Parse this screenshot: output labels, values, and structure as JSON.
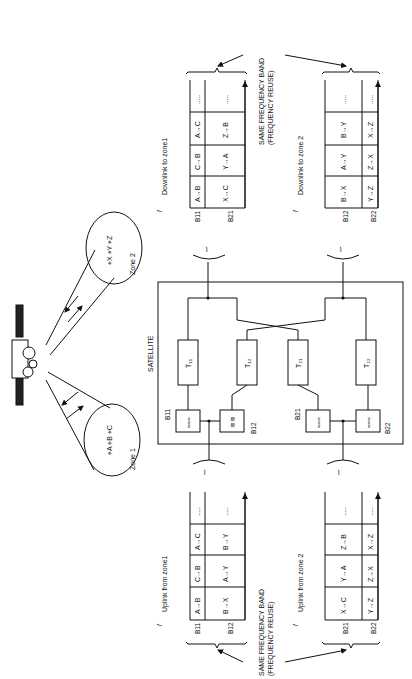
{
  "figure": {
    "orientation": "rotated-90-ccw",
    "satellite_label": "SATELLITE",
    "zones": [
      {
        "label": "Zone 1",
        "stations": [
          "A",
          "B",
          "C"
        ]
      },
      {
        "label": "Zone 2",
        "stations": [
          "X",
          "Y",
          "Z"
        ]
      }
    ],
    "transponders": [
      "T11",
      "T12",
      "T21",
      "T22"
    ],
    "filters": [
      "B11",
      "B12",
      "B21",
      "B22"
    ],
    "annotation": {
      "line1": "SAME FREQUENCY BAND",
      "line2": "(FREQUENCY REUSE)"
    },
    "axis_label": "f",
    "frames": {
      "uplink_zone1": {
        "title": "Uplink from zone1",
        "rows": [
          {
            "band": "B11",
            "cells": [
              "A→B",
              "C→B",
              "A→C",
              "....."
            ]
          },
          {
            "band": "B12",
            "cells": [
              "B→X",
              "A→Y",
              "B→Y",
              "....."
            ]
          }
        ]
      },
      "uplink_zone2": {
        "title": "Uplink from zone 2",
        "rows": [
          {
            "band": "B21",
            "cells": [
              "X→C",
              "Y→A",
              "Z→B",
              "....."
            ]
          },
          {
            "band": "B22",
            "cells": [
              "Y→Z",
              "Z→X",
              "X→Z",
              "....."
            ]
          }
        ]
      },
      "downlink_zone1": {
        "title": "Downlink to zone1",
        "rows": [
          {
            "band": "B11",
            "cells": [
              "A→B",
              "C→B",
              "A→C",
              "....."
            ]
          },
          {
            "band": "B21",
            "cells": [
              "X→C",
              "Y→A",
              "Z→B",
              "....."
            ]
          }
        ]
      },
      "downlink_zone2": {
        "title": "Downlink to zone 2",
        "rows": [
          {
            "band": "B12",
            "cells": [
              "B→X",
              "A→Y",
              "B→Y",
              "....."
            ]
          },
          {
            "band": "B22",
            "cells": [
              "Y→Z",
              "Z→X",
              "X→Z",
              "....."
            ]
          }
        ]
      }
    }
  }
}
